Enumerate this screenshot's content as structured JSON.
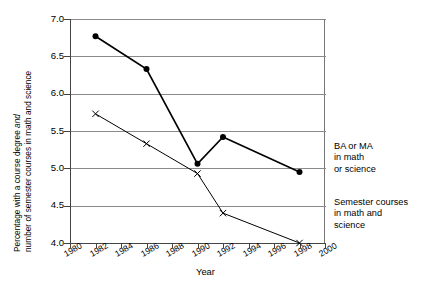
{
  "chart_data": {
    "type": "line",
    "title": "",
    "subtitle": "",
    "xlabel": "Year",
    "ylabel": "Percentage with a course degree and number of semester courses in math and science",
    "ylabel_line1": "Percentage with a course degree ",
    "ylabel_line1_italic": "and",
    "ylabel_line2": "number of semester courses in math and science",
    "xlim": [
      1980,
      2000
    ],
    "ylim": [
      4.0,
      7.0
    ],
    "xticks": [
      1980,
      1982,
      1984,
      1986,
      1988,
      1990,
      1992,
      1994,
      1996,
      1998,
      2000
    ],
    "xtick_labels": [
      "1980",
      "1982",
      "1984",
      "1986",
      "1988",
      "1990",
      "1992",
      "1994",
      "1996",
      "1998",
      "2000"
    ],
    "yticks": [
      4.0,
      4.5,
      5.0,
      5.5,
      6.0,
      6.5,
      7.0
    ],
    "ytick_labels": [
      "4.0",
      "4.5",
      "5.0",
      "5.5",
      "6.0",
      "6.5",
      "7.0"
    ],
    "grid": true,
    "grid_axis": "y",
    "legend_position": "right-outside",
    "series": [
      {
        "name": "BA or MA in math or science",
        "legend_lines": [
          "BA or MA",
          "in math",
          "or science"
        ],
        "marker": "filled-circle",
        "color": "#000000",
        "x": [
          1982,
          1986,
          1990,
          1992,
          1998
        ],
        "values": [
          6.77,
          6.33,
          5.06,
          5.42,
          4.95
        ]
      },
      {
        "name": "Semester courses in math and science",
        "legend_lines": [
          "Semester courses",
          "in math and",
          "science"
        ],
        "marker": "x",
        "color": "#000000",
        "x": [
          1982,
          1986,
          1990,
          1992,
          1998
        ],
        "values": [
          5.73,
          5.33,
          4.93,
          4.4,
          4.0
        ]
      }
    ]
  },
  "axes": {
    "y_title_lines": [
      "Percentage with a course degree and",
      "number of semester courses in math and science"
    ],
    "x_title": "Year"
  },
  "legend": {
    "series1": {
      "line1": "BA or MA",
      "line2": "in math",
      "line3": "or science"
    },
    "series2": {
      "line1": "Semester courses",
      "line2": "in math and",
      "line3": "science"
    }
  }
}
